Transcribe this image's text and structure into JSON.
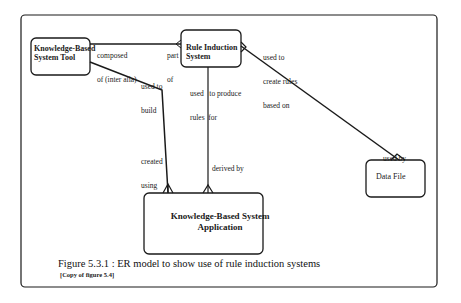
{
  "diagram": {
    "type": "ER model",
    "entities": [
      {
        "id": "kbs_tool",
        "label_line1": "Knowledge-Based",
        "label_line2": "System Tool"
      },
      {
        "id": "rule_induction",
        "label_line1": "Rule Induction",
        "label_line2": "System"
      },
      {
        "id": "data_file",
        "label_line1": "Data File",
        "label_line2": ""
      },
      {
        "id": "kbs_application",
        "label_line1": "Knowledge-Based System",
        "label_line2": "Application"
      }
    ],
    "relationships": [
      {
        "from": "kbs_tool",
        "to": "rule_induction",
        "label_from_line1": "composed",
        "label_from_line2": "of (inter alia)",
        "label_to_line1": "part",
        "label_to_line2": "of"
      },
      {
        "from": "kbs_tool",
        "to": "kbs_application",
        "label_from_line1": "used to",
        "label_from_line2": "build",
        "label_to_line1": "created",
        "label_to_line2": "using"
      },
      {
        "from": "rule_induction",
        "to": "kbs_application",
        "label_from_line1": "used   to produce",
        "label_from_line2": "rules  for",
        "label_to_line1": "derived by",
        "label_to_line2": ""
      },
      {
        "from": "rule_induction",
        "to": "data_file",
        "label_from_line1": "used to",
        "label_from_line2": "create rules",
        "label_from_line3": "based on",
        "label_to_line1": "used by",
        "label_to_line2": ""
      }
    ]
  },
  "caption": {
    "title": "Figure 5.3.1 :  ER model to show use of rule induction systems",
    "note": "[Copy of figure 5.4]"
  },
  "colors": {
    "line": "#1a1a1a",
    "background": "#ffffff"
  }
}
